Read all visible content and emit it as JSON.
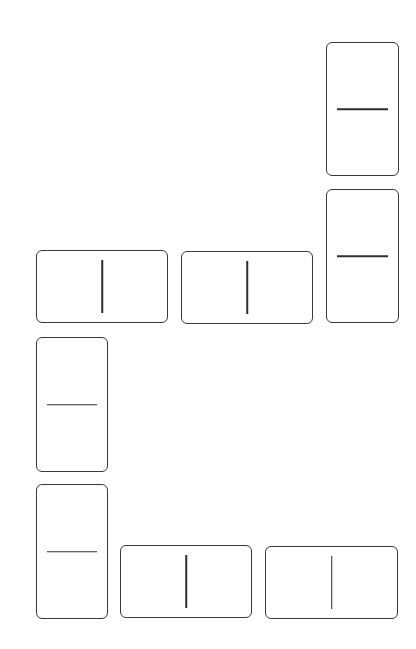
{
  "board": {
    "description": "Domino layout of blank tiles",
    "stroke_color": "#3a3a3a",
    "background": "#ffffff",
    "tiles": [
      {
        "id": 1,
        "orientation": "vertical",
        "x": 326,
        "y": 42,
        "w": 73,
        "h": 134,
        "pips": [
          0,
          0
        ]
      },
      {
        "id": 2,
        "orientation": "vertical",
        "x": 326,
        "y": 189,
        "w": 73,
        "h": 134,
        "pips": [
          0,
          0
        ]
      },
      {
        "id": 3,
        "orientation": "horizontal",
        "x": 36,
        "y": 250,
        "w": 132,
        "h": 73,
        "pips": [
          0,
          0
        ]
      },
      {
        "id": 4,
        "orientation": "horizontal",
        "x": 181,
        "y": 251,
        "w": 132,
        "h": 73,
        "pips": [
          0,
          0
        ]
      },
      {
        "id": 5,
        "orientation": "vertical",
        "x": 36,
        "y": 337,
        "w": 72,
        "h": 135,
        "pips": [
          0,
          0
        ]
      },
      {
        "id": 6,
        "orientation": "vertical",
        "x": 36,
        "y": 484,
        "w": 72,
        "h": 135,
        "pips": [
          0,
          0
        ]
      },
      {
        "id": 7,
        "orientation": "horizontal",
        "x": 120,
        "y": 545,
        "w": 132,
        "h": 73,
        "pips": [
          0,
          0
        ]
      },
      {
        "id": 8,
        "orientation": "horizontal",
        "x": 265,
        "y": 546,
        "w": 133,
        "h": 73,
        "pips": [
          0,
          0
        ]
      }
    ]
  }
}
